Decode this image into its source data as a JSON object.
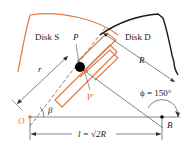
{
  "figure": {
    "type": "mechanism-diagram",
    "labels": {
      "disk_s": "Disk S",
      "disk_d": "Disk D",
      "point_p": "P",
      "point_p_prime": "P′",
      "radius_small": "r",
      "radius_large": "R",
      "angle_beta": "β",
      "angle_phi": "ϕ = 150°",
      "origin": "O",
      "point_b": "B",
      "distance": "l = √2R"
    },
    "values": {
      "phi_deg": 150,
      "distance_expr": "l = √2R"
    },
    "colors": {
      "disk_s": "#e07a40",
      "disk_d": "#1a1a1a",
      "slot": "#e07a40",
      "pin": "#000000",
      "dimension_lines": "#333333",
      "origin_dot": "#e07a40"
    }
  }
}
